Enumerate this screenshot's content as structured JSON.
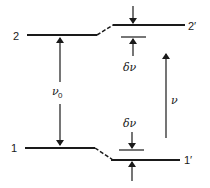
{
  "diagram": {
    "type": "energy-level-diagram",
    "levels": [
      {
        "id": "level-2",
        "label": "2"
      },
      {
        "id": "level-2-prime",
        "label": "2′"
      },
      {
        "id": "level-1",
        "label": "1"
      },
      {
        "id": "level-1-prime",
        "label": "1′"
      }
    ],
    "annotations": {
      "nu0": "ν",
      "nu0_sub": "0",
      "delta_nu_upper": "δν",
      "delta_nu_lower": "δν",
      "nu": "ν"
    },
    "colors": {
      "line": "#1a1a1a",
      "background": "#ffffff"
    }
  }
}
